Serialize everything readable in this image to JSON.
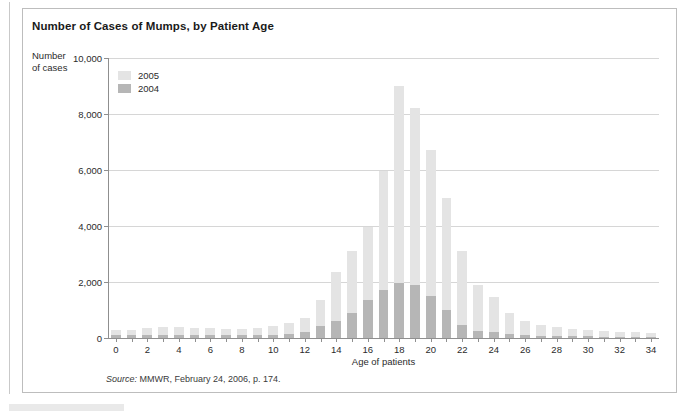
{
  "figure": {
    "title": "Number of Cases of Mumps, by Patient Age",
    "y_axis_title_line1": "Number",
    "y_axis_title_line2": "of cases",
    "source_prefix": "Source:",
    "source_text": " MMWR, February 24, 2006, p. 174."
  },
  "legend": {
    "position": "top-left-inside",
    "entries": [
      {
        "label": "2005",
        "color": "#e4e4e4"
      },
      {
        "label": "2004",
        "color": "#b6b6b6"
      }
    ]
  },
  "colors": {
    "series_2005": "#e4e4e4",
    "series_2004": "#b6b6b6",
    "gridline": "#d6d6d6",
    "axis": "#8f8f8f",
    "frame": "#bdbdbd",
    "text": "#2b2b2b"
  },
  "chart_data": {
    "type": "bar",
    "title": "Number of Cases of Mumps, by Patient Age",
    "subtitle": "",
    "xlabel": "Age of patients",
    "ylabel": "Number of cases",
    "grid": true,
    "stacked": true,
    "legend_position": "top-left",
    "xlim": [
      -0.5,
      34.5
    ],
    "ylim": [
      0,
      10000
    ],
    "ytick_values": [
      0,
      2000,
      4000,
      6000,
      8000,
      10000
    ],
    "ytick_labels": [
      "0",
      "2,000",
      "4,000",
      "6,000",
      "8,000",
      "10,000"
    ],
    "xtick_values": [
      0,
      2,
      4,
      6,
      8,
      10,
      12,
      14,
      16,
      18,
      20,
      22,
      24,
      26,
      28,
      30,
      32,
      34
    ],
    "xtick_labels": [
      "0",
      "2",
      "4",
      "6",
      "8",
      "10",
      "12",
      "14",
      "16",
      "18",
      "20",
      "22",
      "24",
      "26",
      "28",
      "30",
      "32",
      "34"
    ],
    "categories": [
      0,
      1,
      2,
      3,
      4,
      5,
      6,
      7,
      8,
      9,
      10,
      11,
      12,
      13,
      14,
      15,
      16,
      17,
      18,
      19,
      20,
      21,
      22,
      23,
      24,
      25,
      26,
      27,
      28,
      29,
      30,
      31,
      32,
      33,
      34
    ],
    "series": [
      {
        "name": "2005",
        "color": "#e4e4e4",
        "values": [
          270,
          300,
          340,
          380,
          400,
          340,
          360,
          320,
          310,
          360,
          430,
          520,
          700,
          1350,
          2350,
          3100,
          3950,
          5950,
          9000,
          8200,
          6700,
          5000,
          3100,
          1900,
          1450,
          900,
          620,
          480,
          380,
          320,
          280,
          250,
          220,
          200,
          190
        ]
      },
      {
        "name": "2004",
        "color": "#b6b6b6",
        "values": [
          90,
          100,
          110,
          120,
          120,
          110,
          110,
          100,
          95,
          100,
          120,
          150,
          220,
          420,
          620,
          900,
          1350,
          1700,
          1950,
          1900,
          1500,
          1000,
          450,
          260,
          200,
          130,
          100,
          80,
          70,
          60,
          55,
          50,
          45,
          40,
          40
        ]
      }
    ]
  }
}
